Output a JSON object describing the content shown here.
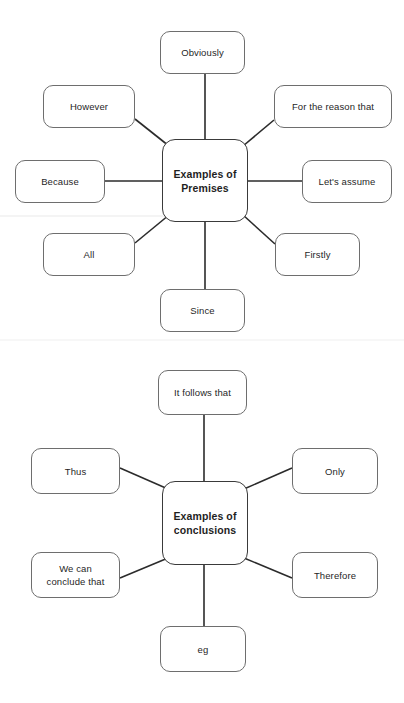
{
  "page": {
    "background_color": "#ffffff",
    "text_color": "#1f1f1f",
    "line_color": "#2b2b2b",
    "node_border_color": "#6e6e6e",
    "center_border_color": "#3a3a3a"
  },
  "diagrams": [
    {
      "id": "premises",
      "center": {
        "label": "Examples of\nPremises",
        "x": 162,
        "y": 139,
        "w": 86,
        "h": 83
      },
      "nodes": [
        {
          "key": "obviously",
          "label": "Obviously",
          "x": 160,
          "y": 31,
          "w": 85,
          "h": 43
        },
        {
          "key": "however",
          "label": "However",
          "x": 43,
          "y": 85,
          "w": 92,
          "h": 43
        },
        {
          "key": "reason",
          "label": "For the reason that",
          "x": 274,
          "y": 85,
          "w": 118,
          "h": 43
        },
        {
          "key": "because",
          "label": "Because",
          "x": 15,
          "y": 160,
          "w": 90,
          "h": 43
        },
        {
          "key": "lets-assume",
          "label": "Let's assume",
          "x": 302,
          "y": 160,
          "w": 90,
          "h": 43
        },
        {
          "key": "all",
          "label": "All",
          "x": 43,
          "y": 233,
          "w": 92,
          "h": 43
        },
        {
          "key": "firstly",
          "label": "Firstly",
          "x": 275,
          "y": 233,
          "w": 85,
          "h": 43
        },
        {
          "key": "since",
          "label": "Since",
          "x": 160,
          "y": 289,
          "w": 85,
          "h": 43
        }
      ]
    },
    {
      "id": "conclusions",
      "center": {
        "label": "Examples of\nconclusions",
        "x": 162,
        "y": 481,
        "w": 86,
        "h": 84
      },
      "nodes": [
        {
          "key": "it-follows-that",
          "label": "It follows that",
          "x": 158,
          "y": 370,
          "w": 89,
          "h": 45
        },
        {
          "key": "thus",
          "label": "Thus",
          "x": 31,
          "y": 448,
          "w": 89,
          "h": 46
        },
        {
          "key": "only",
          "label": "Only",
          "x": 292,
          "y": 448,
          "w": 86,
          "h": 46
        },
        {
          "key": "we-can-conclude",
          "label": "We can\nconclude that",
          "x": 31,
          "y": 552,
          "w": 89,
          "h": 46
        },
        {
          "key": "therefore",
          "label": "Therefore",
          "x": 292,
          "y": 552,
          "w": 86,
          "h": 46
        },
        {
          "key": "eg",
          "label": "eg",
          "x": 160,
          "y": 626,
          "w": 86,
          "h": 46
        }
      ]
    }
  ],
  "connectors": [
    {
      "diagram": "premises",
      "from": "center",
      "to": "obviously",
      "x1": 205,
      "y1": 139,
      "x2": 205,
      "y2": 74
    },
    {
      "diagram": "premises",
      "from": "center",
      "to": "however",
      "x1": 169,
      "y1": 146,
      "x2": 135,
      "y2": 119
    },
    {
      "diagram": "premises",
      "from": "center",
      "to": "reason",
      "x1": 243,
      "y1": 146,
      "x2": 274,
      "y2": 120
    },
    {
      "diagram": "premises",
      "from": "center",
      "to": "because",
      "x1": 162,
      "y1": 181,
      "x2": 105,
      "y2": 181
    },
    {
      "diagram": "premises",
      "from": "center",
      "to": "lets-assume",
      "x1": 248,
      "y1": 181,
      "x2": 302,
      "y2": 181
    },
    {
      "diagram": "premises",
      "from": "center",
      "to": "all",
      "x1": 169,
      "y1": 215,
      "x2": 135,
      "y2": 243
    },
    {
      "diagram": "premises",
      "from": "center",
      "to": "firstly",
      "x1": 243,
      "y1": 215,
      "x2": 275,
      "y2": 244
    },
    {
      "diagram": "premises",
      "from": "center",
      "to": "since",
      "x1": 205,
      "y1": 222,
      "x2": 205,
      "y2": 289
    },
    {
      "diagram": "conclusions",
      "from": "center",
      "to": "it-follows-that",
      "x1": 204,
      "y1": 481,
      "x2": 204,
      "y2": 415
    },
    {
      "diagram": "conclusions",
      "from": "center",
      "to": "thus",
      "x1": 168,
      "y1": 489,
      "x2": 120,
      "y2": 468
    },
    {
      "diagram": "conclusions",
      "from": "center",
      "to": "only",
      "x1": 244,
      "y1": 489,
      "x2": 292,
      "y2": 468
    },
    {
      "diagram": "conclusions",
      "from": "center",
      "to": "we-can-conclude",
      "x1": 168,
      "y1": 558,
      "x2": 120,
      "y2": 578
    },
    {
      "diagram": "conclusions",
      "from": "center",
      "to": "therefore",
      "x1": 244,
      "y1": 558,
      "x2": 292,
      "y2": 578
    },
    {
      "diagram": "conclusions",
      "from": "center",
      "to": "eg",
      "x1": 204,
      "y1": 565,
      "x2": 204,
      "y2": 626
    }
  ]
}
